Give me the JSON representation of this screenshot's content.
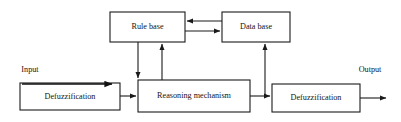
{
  "diagram": {
    "type": "block-flow-diagram",
    "background_color": "#ffffff",
    "line_color": "#1a1a1a",
    "text_color": "#141414",
    "boxes": [
      {
        "id": "rule-base",
        "label": "Rule base"
      },
      {
        "id": "data-base",
        "label": "Data base"
      },
      {
        "id": "defuzzification-input",
        "label": "Defuzzification"
      },
      {
        "id": "reasoning-mechanism",
        "label": "Reasoning mechanism"
      },
      {
        "id": "defuzzification-output",
        "label": "Defuzzification"
      }
    ],
    "io_labels": [
      {
        "id": "input",
        "label": "Input"
      },
      {
        "id": "output",
        "label": "Output"
      }
    ],
    "connections": [
      {
        "id": "data-base-to-rule-base",
        "from": "data-base",
        "to": "rule-base",
        "direction": "left"
      },
      {
        "id": "rule-base-to-data-base",
        "from": "rule-base",
        "to": "data-base",
        "direction": "right"
      },
      {
        "id": "rule-base-to-reasoning",
        "from": "rule-base",
        "to": "reasoning-mechanism",
        "direction": "down"
      },
      {
        "id": "reasoning-to-rule-base",
        "from": "reasoning-mechanism",
        "to": "rule-base",
        "direction": "up"
      },
      {
        "id": "reasoning-to-data-base",
        "from": "reasoning-mechanism",
        "to": "data-base",
        "direction": "up"
      },
      {
        "id": "input-to-defuzzification-input",
        "from": "input",
        "to": "defuzzification-input",
        "direction": "right"
      },
      {
        "id": "defuzzification-input-to-reasoning",
        "from": "defuzzification-input",
        "to": "reasoning-mechanism",
        "direction": "right"
      },
      {
        "id": "reasoning-to-defuzzification-output",
        "from": "reasoning-mechanism",
        "to": "defuzzification-output",
        "direction": "right"
      },
      {
        "id": "defuzzification-output-to-output",
        "from": "defuzzification-output",
        "to": "output",
        "direction": "right"
      }
    ]
  }
}
